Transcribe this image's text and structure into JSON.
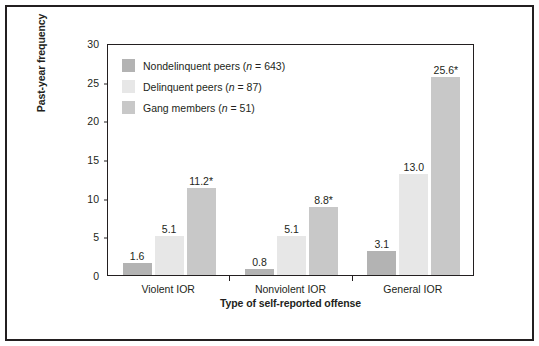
{
  "chart_data": {
    "type": "bar",
    "title": "",
    "xlabel": "Type of self-reported offense",
    "ylabel": "Past-year frequency",
    "categories": [
      "Violent IOR",
      "Nonviolent IOR",
      "General IOR"
    ],
    "series": [
      {
        "name": "Nondelinquent peers (n = 643)",
        "color": "#b3b3b3",
        "values": [
          1.6,
          0.8,
          3.1
        ],
        "labels": [
          "1.6",
          "0.8",
          "3.1"
        ]
      },
      {
        "name": "Delinquent peers (n = 87)",
        "color": "#e7e7e7",
        "values": [
          5.1,
          5.1,
          13.0
        ],
        "labels": [
          "5.1",
          "5.1",
          "13.0"
        ]
      },
      {
        "name": "Gang members (n = 51)",
        "color": "#c8c8c8",
        "values": [
          11.2,
          8.8,
          25.6
        ],
        "labels": [
          "11.2*",
          "8.8*",
          "25.6*"
        ]
      }
    ],
    "ylim": [
      0,
      30
    ],
    "yticks": [
      0,
      5,
      10,
      15,
      20,
      25,
      30
    ],
    "ytick_labels": [
      "0",
      "5",
      "10",
      "15",
      "20",
      "25",
      "30"
    ],
    "grid": false,
    "legend_position": "top-left",
    "legend": [
      {
        "label_prefix": "Nondelinquent peers (",
        "label_italic": "n",
        "label_suffix": " = 643)",
        "color": "#b3b3b3"
      },
      {
        "label_prefix": "Delinquent peers (",
        "label_italic": "n",
        "label_suffix": " = 87)",
        "color": "#e7e7e7"
      },
      {
        "label_prefix": "Gang members (",
        "label_italic": "n",
        "label_suffix": " = 51)",
        "color": "#c8c8c8"
      }
    ],
    "annotations": [
      "* indicates statistical significance"
    ]
  },
  "figure": {
    "border_color": "#231f20",
    "background": "#ffffff",
    "text_color": "#231f20"
  }
}
